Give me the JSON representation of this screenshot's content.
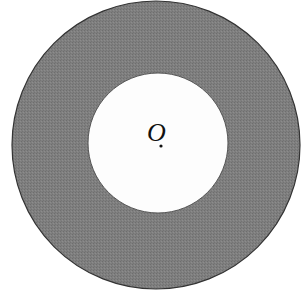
{
  "diagram": {
    "type": "annulus",
    "outer_circle": {
      "cx": 156,
      "cy": 145,
      "r": 144,
      "fill": "#7d7d7d",
      "stroke": "#333333"
    },
    "inner_circle": {
      "cx": 158,
      "cy": 143,
      "r": 70,
      "fill": "#fdfdfd",
      "stroke": "#444444"
    },
    "center_label": "O",
    "center_point": {
      "x": 161,
      "y": 145
    }
  }
}
